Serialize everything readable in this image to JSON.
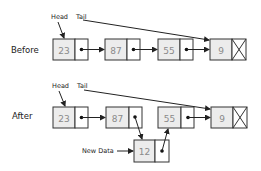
{
  "diagram": {
    "type": "linked-list-insertion",
    "colors": {
      "cell_fill": "#ececec",
      "border": "#333333",
      "value_text": "#8a8a8a",
      "label_text": "#222222"
    },
    "before": {
      "label": "Before",
      "head_label": "Head",
      "tail_label": "Tail",
      "nodes": [
        {
          "value": "23"
        },
        {
          "value": "87"
        },
        {
          "value": "55"
        },
        {
          "value": "9",
          "null_pointer": true
        }
      ]
    },
    "after": {
      "label": "After",
      "head_label": "Head",
      "tail_label": "Tail",
      "nodes": [
        {
          "value": "23"
        },
        {
          "value": "87"
        },
        {
          "value": "55"
        },
        {
          "value": "9",
          "null_pointer": true
        }
      ],
      "new_node": {
        "value": "12",
        "label": "New Data"
      }
    }
  }
}
